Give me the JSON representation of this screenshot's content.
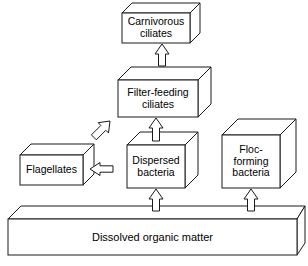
{
  "diagram": {
    "type": "flow-diagram",
    "style": "3d-isometric-boxes",
    "line_color": "#1a1a1a",
    "box_fill": "#ffffff",
    "background": "#ffffff",
    "nodes": [
      {
        "id": "carnivorous_ciliates",
        "label": "Carnivorous\nciliates",
        "level": 4
      },
      {
        "id": "filter_feeding_ciliates",
        "label": "Filter-feeding\nciliates",
        "level": 3
      },
      {
        "id": "dispersed_bacteria",
        "label": "Dispersed\nbacteria",
        "level": 2
      },
      {
        "id": "flagellates",
        "label": "Flagellates",
        "level": 2
      },
      {
        "id": "floc_forming_bacteria",
        "label": "Floc-\nforming\nbacteria",
        "level": 2
      },
      {
        "id": "dissolved_organic_matter",
        "label": "Dissolved organic matter",
        "level": 1
      }
    ],
    "arrows": [
      {
        "id": "arrow-filter-to-carnivorous",
        "from": "filter_feeding_ciliates",
        "to": "carnivorous_ciliates",
        "direction": "up"
      },
      {
        "id": "arrow-dispersed-to-filter",
        "from": "dispersed_bacteria",
        "to": "filter_feeding_ciliates",
        "direction": "up"
      },
      {
        "id": "arrow-flagellates-to-filter",
        "from": "flagellates",
        "to": "filter_feeding_ciliates",
        "direction": "up-right"
      },
      {
        "id": "arrow-dispersed-to-flagellates",
        "from": "dispersed_bacteria",
        "to": "flagellates",
        "direction": "left"
      },
      {
        "id": "arrow-dom-to-dispersed",
        "from": "dissolved_organic_matter",
        "to": "dispersed_bacteria",
        "direction": "up"
      },
      {
        "id": "arrow-dom-to-floc",
        "from": "dissolved_organic_matter",
        "to": "floc_forming_bacteria",
        "direction": "up"
      }
    ]
  }
}
